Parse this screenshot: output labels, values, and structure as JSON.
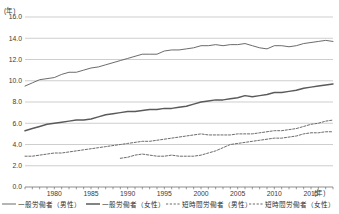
{
  "chart_data": {
    "type": "line",
    "title": "",
    "xlabel": "(年)",
    "ylabel": "(年)",
    "y_unit_label": "(年)",
    "x_unit_label": "(年)",
    "xlim": [
      1976,
      2018
    ],
    "ylim": [
      0.0,
      16.0
    ],
    "ytick_labels": [
      "0.0",
      "2.0",
      "4.0",
      "6.0",
      "8.0",
      "10.0",
      "12.0",
      "14.0",
      "16.0"
    ],
    "ytick_values": [
      0.0,
      2.0,
      4.0,
      6.0,
      8.0,
      10.0,
      12.0,
      14.0,
      16.0
    ],
    "xtick_labels": [
      "1980",
      "1985",
      "1990",
      "1995",
      "2000",
      "2005",
      "2010",
      "2015"
    ],
    "xtick_values": [
      1980,
      1985,
      1990,
      1995,
      2000,
      2005,
      2010,
      2015
    ],
    "grid": true,
    "legend_position": "bottom",
    "series": [
      {
        "name": "一般労働者（男性）",
        "style": "solid",
        "width": 0.9,
        "x": [
          1976,
          1977,
          1978,
          1979,
          1980,
          1981,
          1982,
          1983,
          1984,
          1985,
          1986,
          1987,
          1988,
          1989,
          1990,
          1991,
          1992,
          1993,
          1994,
          1995,
          1996,
          1997,
          1998,
          1999,
          2000,
          2001,
          2002,
          2003,
          2004,
          2005,
          2006,
          2007,
          2008,
          2009,
          2010,
          2011,
          2012,
          2013,
          2014,
          2015,
          2016,
          2017,
          2018
        ],
        "values": [
          9.5,
          9.8,
          10.1,
          10.2,
          10.3,
          10.6,
          10.8,
          10.8,
          11.0,
          11.2,
          11.3,
          11.5,
          11.7,
          11.9,
          12.1,
          12.3,
          12.5,
          12.5,
          12.5,
          12.8,
          12.9,
          12.9,
          13.0,
          13.1,
          13.3,
          13.3,
          13.4,
          13.3,
          13.4,
          13.4,
          13.5,
          13.3,
          13.1,
          13.0,
          13.3,
          13.3,
          13.2,
          13.3,
          13.5,
          13.6,
          13.7,
          13.8,
          13.7
        ]
      },
      {
        "name": "一般労働者（女性）",
        "style": "solid",
        "width": 1.5,
        "x": [
          1976,
          1977,
          1978,
          1979,
          1980,
          1981,
          1982,
          1983,
          1984,
          1985,
          1986,
          1987,
          1988,
          1989,
          1990,
          1991,
          1992,
          1993,
          1994,
          1995,
          1996,
          1997,
          1998,
          1999,
          2000,
          2001,
          2002,
          2003,
          2004,
          2005,
          2006,
          2007,
          2008,
          2009,
          2010,
          2011,
          2012,
          2013,
          2014,
          2015,
          2016,
          2017,
          2018
        ],
        "values": [
          5.3,
          5.5,
          5.7,
          5.9,
          6.0,
          6.1,
          6.2,
          6.3,
          6.3,
          6.4,
          6.6,
          6.8,
          6.9,
          7.0,
          7.1,
          7.1,
          7.2,
          7.3,
          7.3,
          7.4,
          7.4,
          7.5,
          7.6,
          7.8,
          8.0,
          8.1,
          8.2,
          8.2,
          8.3,
          8.4,
          8.6,
          8.5,
          8.6,
          8.7,
          8.9,
          8.9,
          9.0,
          9.1,
          9.3,
          9.4,
          9.5,
          9.6,
          9.7
        ]
      },
      {
        "name": "短時間労働者（男性）",
        "style": "dashed",
        "width": 0.9,
        "x": [
          1989,
          1990,
          1991,
          1992,
          1993,
          1994,
          1995,
          1996,
          1997,
          1998,
          1999,
          2000,
          2001,
          2002,
          2003,
          2004,
          2005,
          2006,
          2007,
          2008,
          2009,
          2010,
          2011,
          2012,
          2013,
          2014,
          2015,
          2016,
          2017,
          2018
        ],
        "values": [
          2.7,
          2.8,
          3.0,
          3.1,
          3.0,
          2.9,
          2.9,
          3.0,
          2.9,
          2.9,
          2.9,
          3.0,
          3.2,
          3.4,
          3.7,
          4.0,
          4.1,
          4.2,
          4.3,
          4.4,
          4.5,
          4.6,
          4.6,
          4.7,
          4.8,
          5.0,
          5.1,
          5.1,
          5.2,
          5.2
        ]
      },
      {
        "name": "短時間労働者（女性）",
        "style": "dashed",
        "width": 0.9,
        "x": [
          1976,
          1977,
          1978,
          1979,
          1980,
          1981,
          1982,
          1983,
          1984,
          1985,
          1986,
          1987,
          1988,
          1989,
          1990,
          1991,
          1992,
          1993,
          1994,
          1995,
          1996,
          1997,
          1998,
          1999,
          2000,
          2001,
          2002,
          2003,
          2004,
          2005,
          2006,
          2007,
          2008,
          2009,
          2010,
          2011,
          2012,
          2013,
          2014,
          2015,
          2016,
          2017,
          2018
        ],
        "values": [
          2.9,
          2.9,
          3.0,
          3.1,
          3.2,
          3.2,
          3.3,
          3.4,
          3.5,
          3.6,
          3.7,
          3.8,
          3.9,
          4.0,
          4.1,
          4.2,
          4.3,
          4.3,
          4.4,
          4.5,
          4.6,
          4.7,
          4.8,
          4.9,
          5.0,
          4.9,
          4.9,
          4.9,
          4.9,
          5.0,
          5.0,
          5.0,
          5.1,
          5.2,
          5.3,
          5.3,
          5.4,
          5.5,
          5.7,
          5.9,
          6.0,
          6.2,
          6.3
        ]
      }
    ]
  },
  "legend": {
    "items": [
      {
        "label": "一般労働者（男性）"
      },
      {
        "label": "一般労働者（女性）"
      },
      {
        "label": "短時間労働者（男性）"
      },
      {
        "label": "短時間労働者（女性）"
      }
    ]
  }
}
